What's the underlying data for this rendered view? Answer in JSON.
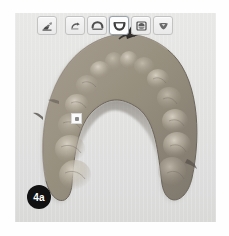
{
  "app": {
    "title": "Intraoral Scan Viewer",
    "figure_label": "4a"
  },
  "viewer": {
    "background_color": "#e4e4e2",
    "model_name": "lower-dental-arch-3d-scan",
    "model_color": "#9a9186",
    "model_highlight_color": "#cfc8bd",
    "model_shadow_color": "#6f6862",
    "artifact_note": "scan-spike-artifact"
  },
  "toolbar": {
    "buttons": [
      {
        "name": "model-select-tool",
        "icon": "cursor-model-icon",
        "label": "Select",
        "active": false
      },
      {
        "name": "rotate-view-tool",
        "icon": "rotate-arrow-icon",
        "label": "Rotate",
        "active": false
      },
      {
        "name": "upper-arch-view",
        "icon": "upper-arch-icon",
        "label": "Upper Arch",
        "active": false
      },
      {
        "name": "lower-arch-view",
        "icon": "lower-arch-icon",
        "label": "Lower Arch",
        "active": true
      },
      {
        "name": "occlusion-view",
        "icon": "occlusion-icon",
        "label": "Occlusion",
        "active": false
      },
      {
        "name": "bite-down-view",
        "icon": "bite-chevron-down-icon",
        "label": "Bite",
        "active": false
      }
    ]
  },
  "marker": {
    "name": "measurement-marker",
    "icon": "marker-dot-icon"
  }
}
